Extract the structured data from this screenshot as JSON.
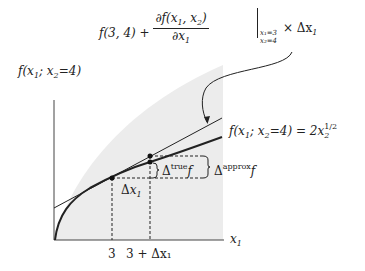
{
  "diagram": {
    "type": "linear-approximation-illustration",
    "colors": {
      "ink": "#222222",
      "shade": "#ececec"
    },
    "formula": {
      "lhs_value": "f(3, 4) +",
      "partial_num": "∂f(x",
      "partial_num_sub1": "1",
      "partial_num_mid": ", x",
      "partial_num_sub2": "2",
      "partial_num_end": ")",
      "partial_den": "∂x",
      "partial_den_sub": "1",
      "eval_cond1": "x₁=3",
      "eval_cond2": "x₂=4",
      "times_dx": "× Δx",
      "times_dx_sub": "1",
      "equals": "= 2√3 +",
      "rhs_num": "Δx",
      "rhs_num_sub": "1",
      "rhs_den": "√3"
    },
    "y_axis_label": {
      "text": "f(x",
      "sub1": "1",
      "mid": "; x",
      "sub2": "2",
      "end": "=4)"
    },
    "x_axis_label": {
      "text": "x",
      "sub": "1"
    },
    "curve_label": {
      "text": "f(x",
      "sub1": "1",
      "mid": "; x",
      "sub2": "2",
      "end": "=4) = 2x",
      "sub3": "2",
      "sup": "1/2"
    },
    "tick_labels": [
      "3",
      "3 + Δx₁"
    ],
    "delta_x_label": {
      "text": "Δx",
      "sub": "1"
    },
    "delta_true_label": {
      "delta": "Δ",
      "sup": "true",
      "f": "f"
    },
    "delta_approx_label": {
      "delta": "Δ",
      "sup": "approx",
      "f": "f"
    }
  }
}
